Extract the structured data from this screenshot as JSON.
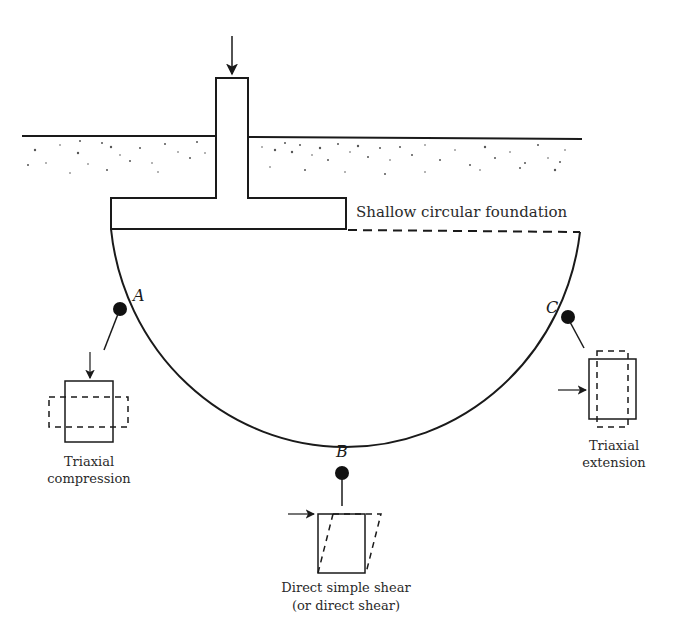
{
  "figure": {
    "title_label": "Shallow circular foundation",
    "points": [
      {
        "id": "A",
        "label": "A",
        "test": "Triaxial compression",
        "test_lines": [
          "Triaxial",
          "compression"
        ]
      },
      {
        "id": "B",
        "label": "B",
        "test": "Direct simple shear (or direct shear)",
        "test_lines": [
          "Direct simple shear",
          "(or direct shear)"
        ]
      },
      {
        "id": "C",
        "label": "C",
        "test": "Triaxial extension",
        "test_lines": [
          "Triaxial",
          "extension"
        ]
      }
    ],
    "colors": {
      "line": "#1a1a1a",
      "text": "#2a2a2a",
      "background": "#ffffff"
    }
  }
}
